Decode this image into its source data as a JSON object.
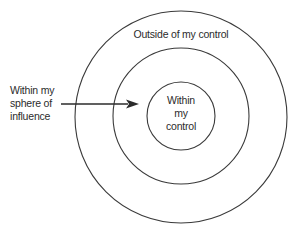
{
  "diagram": {
    "type": "concentric-circles",
    "colors": {
      "background": "#ffffff",
      "stroke": "#3a3a3a",
      "text": "#2b2b2b"
    },
    "circles": [
      {
        "name": "outer",
        "cx": 181,
        "cy": 117,
        "r": 106
      },
      {
        "name": "middle",
        "cx": 181,
        "cy": 116,
        "r": 68
      },
      {
        "name": "inner",
        "cx": 181,
        "cy": 116,
        "r": 34
      }
    ],
    "labels": {
      "outer": {
        "lines": [
          "Outside of my control"
        ]
      },
      "influence": {
        "lines": [
          "Within my",
          "sphere of",
          "influence"
        ]
      },
      "inner": {
        "lines": [
          "Within",
          "my",
          "control"
        ]
      }
    },
    "arrow": {
      "x1": 61,
      "y1": 104,
      "x2": 139,
      "y2": 104,
      "points_to": "middle-ring"
    }
  }
}
